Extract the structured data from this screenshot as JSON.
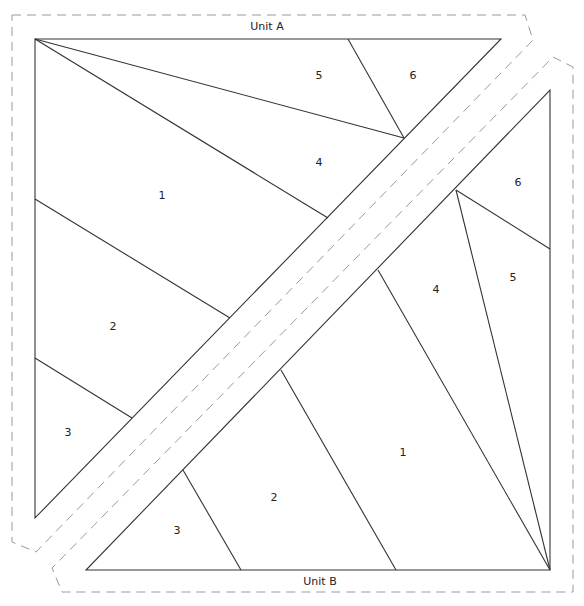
{
  "diagram": {
    "type": "foundation-paper-piecing-pattern",
    "colors": {
      "line": "#333333",
      "dashed": "#999999",
      "text": "#222222"
    },
    "units": [
      {
        "name": "Unit A",
        "title": "Unit A",
        "title_pos": [
          267,
          26
        ],
        "outline": [
          [
            35,
            39
          ],
          [
            501,
            39
          ],
          [
            35,
            518
          ]
        ],
        "seam_allowance": [
          [
            12,
            15
          ],
          [
            525,
            15
          ],
          [
            533,
            40
          ],
          [
            36,
            552
          ],
          [
            12,
            542
          ]
        ],
        "lines": [
          [
            [
              35,
              39
            ],
            [
              404,
              138
            ]
          ],
          [
            [
              348,
              39
            ],
            [
              404,
              138
            ]
          ],
          [
            [
              35,
              39
            ],
            [
              328,
              218
            ]
          ],
          [
            [
              35,
              199
            ],
            [
              230,
              318
            ]
          ],
          [
            [
              35,
              358
            ],
            [
              132,
              418
            ]
          ]
        ],
        "pieces": [
          {
            "label": "1",
            "pos": [
              162,
              195
            ]
          },
          {
            "label": "2",
            "pos": [
              113,
              326
            ]
          },
          {
            "label": "3",
            "pos": [
              68,
              432
            ]
          },
          {
            "label": "4",
            "pos": [
              319,
              162
            ]
          },
          {
            "label": "5",
            "pos": [
              319,
              75
            ]
          },
          {
            "label": "6",
            "pos": [
              413,
              75
            ]
          }
        ]
      },
      {
        "name": "Unit B",
        "title": "Unit B",
        "title_pos": [
          320,
          581
        ],
        "outline": [
          [
            550,
            90
          ],
          [
            550,
            570
          ],
          [
            86,
            570
          ]
        ],
        "seam_allowance": [
          [
            553,
            57
          ],
          [
            573,
            67
          ],
          [
            573,
            592
          ],
          [
            62,
            592
          ],
          [
            52,
            568
          ],
          [
            57,
            563
          ]
        ],
        "lines": [
          [
            [
              456,
              190
            ],
            [
              550,
              570
            ]
          ],
          [
            [
              456,
              190
            ],
            [
              550,
              249
            ]
          ],
          [
            [
              378,
              270
            ],
            [
              550,
              570
            ]
          ],
          [
            [
              281,
              370
            ],
            [
              396,
              570
            ]
          ],
          [
            [
              183,
              470
            ],
            [
              241,
              570
            ]
          ]
        ],
        "pieces": [
          {
            "label": "1",
            "pos": [
              403,
              452
            ]
          },
          {
            "label": "2",
            "pos": [
              274,
              497
            ]
          },
          {
            "label": "3",
            "pos": [
              177,
              530
            ]
          },
          {
            "label": "4",
            "pos": [
              436,
              289
            ]
          },
          {
            "label": "5",
            "pos": [
              513,
              277
            ]
          },
          {
            "label": "6",
            "pos": [
              518,
              182
            ]
          }
        ]
      }
    ]
  }
}
